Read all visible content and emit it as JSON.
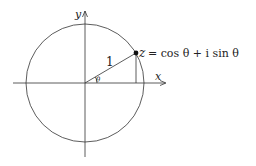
{
  "diagram": {
    "labels": {
      "y_axis": "y",
      "x_axis": "x",
      "radius": "1",
      "angle": "θ",
      "point_var": "z",
      "point_eq": "= cos θ + i sin θ"
    },
    "geometry": {
      "center": [
        85,
        83
      ],
      "radius": 59,
      "point": [
        136,
        53
      ],
      "angle_deg": 30
    },
    "colors": {
      "stroke": "#333333",
      "text": "#222222",
      "background": "#ffffff"
    }
  }
}
